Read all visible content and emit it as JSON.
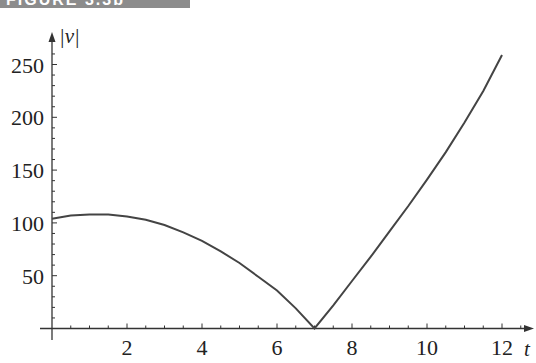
{
  "figure": {
    "banner": "FIGURE 3.3b"
  },
  "chart_data": {
    "type": "line",
    "title": "",
    "xlabel": "t",
    "ylabel": "|v|",
    "xlim": [
      0,
      12.5
    ],
    "ylim": [
      0,
      270
    ],
    "grid": false,
    "legend": null,
    "x_ticks": [
      2,
      4,
      6,
      8,
      10,
      12
    ],
    "x_tick_labels": [
      "2",
      "4",
      "6",
      "8",
      "10",
      "12"
    ],
    "y_ticks": [
      50,
      100,
      150,
      200,
      250
    ],
    "y_tick_labels": [
      "50",
      "100",
      "150",
      "200",
      "250"
    ],
    "series": [
      {
        "name": "|v|",
        "color": "#444444",
        "x": [
          0,
          0.5,
          1,
          1.5,
          2,
          2.5,
          3,
          3.5,
          4,
          4.5,
          5,
          5.5,
          6,
          6.5,
          7,
          7.5,
          8,
          8.5,
          9,
          9.5,
          10,
          10.5,
          11,
          11.5,
          12
        ],
        "y": [
          104,
          107,
          108,
          108,
          106,
          103,
          98,
          91,
          83,
          73,
          62,
          49,
          36,
          19,
          0,
          22,
          45,
          68,
          92,
          116,
          141,
          167,
          195,
          225,
          259
        ]
      }
    ]
  }
}
